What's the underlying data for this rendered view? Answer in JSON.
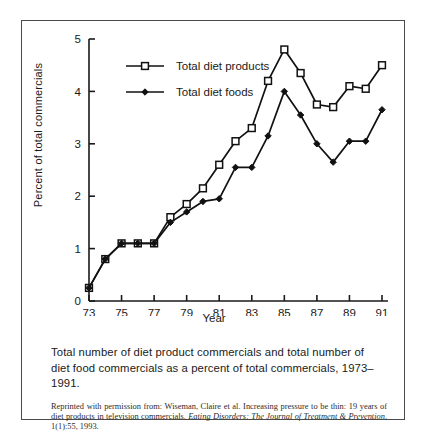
{
  "figure": {
    "caption": "Total number of diet product commercials and total number of diet food commercials as a percent of total commercials, 1973–1991.",
    "credit_plain_1": "Reprinted with permission from: Wiseman, Claire et al. Increasing pressure to be thin: 19 years of diet products in television commercials. ",
    "credit_italic_1": "Eating Disorders: The Journal of Treatment & Prevention",
    "credit_plain_2": ". 1(1):55, 1993."
  },
  "chart_data": {
    "type": "line",
    "title": "",
    "xlabel": "Year",
    "ylabel": "Percent of total commercials",
    "xlim": [
      1973,
      1991
    ],
    "ylim": [
      0,
      5
    ],
    "yticks": [
      "0",
      "1",
      "2",
      "3",
      "4",
      "5"
    ],
    "ytick_values": [
      0,
      1,
      2,
      3,
      4,
      5
    ],
    "xticks": [
      "73",
      "75",
      "77",
      "79",
      "81",
      "83",
      "85",
      "87",
      "89",
      "91"
    ],
    "xtick_values": [
      1973,
      1975,
      1977,
      1979,
      1981,
      1983,
      1985,
      1987,
      1989,
      1991
    ],
    "x": [
      1973,
      1974,
      1975,
      1976,
      1977,
      1978,
      1979,
      1980,
      1981,
      1982,
      1983,
      1984,
      1985,
      1986,
      1987,
      1988,
      1989,
      1990,
      1991
    ],
    "grid": false,
    "legend_position": "upper-left-inside",
    "series": [
      {
        "name": "Total diet products",
        "marker": "open-square",
        "color": "#111111",
        "values": [
          0.25,
          0.8,
          1.1,
          1.1,
          1.1,
          1.6,
          1.85,
          2.15,
          2.6,
          3.05,
          3.3,
          4.2,
          4.8,
          4.35,
          3.75,
          3.7,
          4.1,
          4.05,
          4.5
        ]
      },
      {
        "name": "Total diet foods",
        "marker": "filled-diamond",
        "color": "#111111",
        "values": [
          0.25,
          0.8,
          1.1,
          1.1,
          1.1,
          1.5,
          1.7,
          1.9,
          1.95,
          2.55,
          2.55,
          3.15,
          4.0,
          3.55,
          3.0,
          2.65,
          3.05,
          3.05,
          3.65
        ]
      }
    ]
  }
}
